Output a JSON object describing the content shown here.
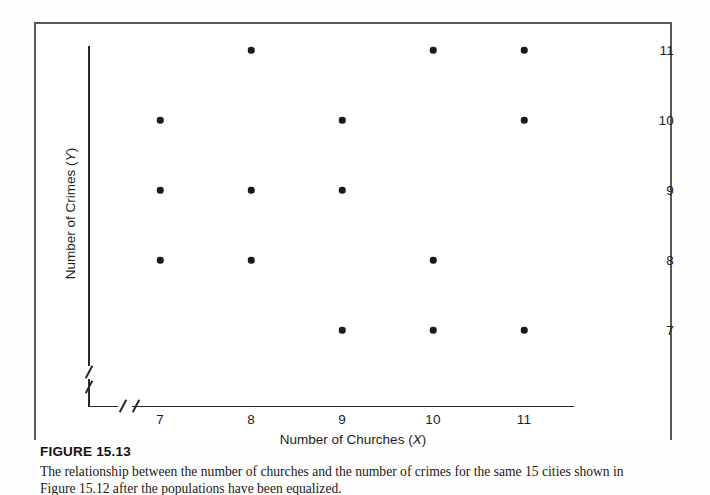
{
  "figure": {
    "number_label": "FIGURE 15.13",
    "caption": "The relationship between the number of churches and the number of crimes for the same 15 cities shown in Figure 15.12 after the populations have been equalized."
  },
  "chart_data": {
    "type": "scatter",
    "title": "",
    "xlabel_text": "Number of Churches (",
    "xlabel_var": "X",
    "xlabel_close": ")",
    "ylabel_text": "Number of Crimes (",
    "ylabel_var": "Y",
    "ylabel_close": ")",
    "x_ticks": [
      7,
      8,
      9,
      10,
      11
    ],
    "y_ticks": [
      11,
      10,
      9,
      8,
      7
    ],
    "xlim": [
      6.5,
      11.5
    ],
    "ylim": [
      6.5,
      11.5
    ],
    "grid": false,
    "legend": "none",
    "axis_break_x": true,
    "axis_break_y": true,
    "point_color": "#1a1a1a",
    "points": [
      {
        "x": 7,
        "y": 10
      },
      {
        "x": 7,
        "y": 9
      },
      {
        "x": 7,
        "y": 8
      },
      {
        "x": 8,
        "y": 11
      },
      {
        "x": 8,
        "y": 9
      },
      {
        "x": 8,
        "y": 8
      },
      {
        "x": 9,
        "y": 10
      },
      {
        "x": 9,
        "y": 9
      },
      {
        "x": 9,
        "y": 7
      },
      {
        "x": 10,
        "y": 11
      },
      {
        "x": 10,
        "y": 8
      },
      {
        "x": 10,
        "y": 7
      },
      {
        "x": 11,
        "y": 11
      },
      {
        "x": 11,
        "y": 10
      },
      {
        "x": 11,
        "y": 7
      }
    ],
    "n_points": 15
  }
}
